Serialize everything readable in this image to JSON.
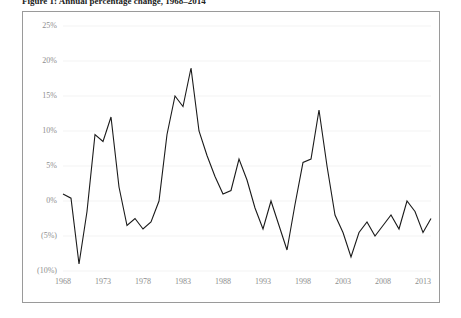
{
  "figure": {
    "caption": "Figure 1: Annual percentage change, 1968–2014"
  },
  "chart_data": {
    "type": "line",
    "title": "",
    "subtitle": "",
    "xlabel": "",
    "ylabel": "",
    "grid": true,
    "legend": "none",
    "xlim": [
      1968,
      2014
    ],
    "ylim": [
      -10,
      25
    ],
    "y_tick_values": [
      25,
      20,
      15,
      10,
      5,
      0,
      -5,
      -10
    ],
    "y_tick_labels": [
      "25%",
      "20%",
      "15%",
      "10%",
      "5%",
      "0%",
      "(5%)",
      "(10%)"
    ],
    "x_tick_values": [
      1968,
      1973,
      1978,
      1983,
      1988,
      1993,
      1998,
      2003,
      2008,
      2013
    ],
    "x_tick_labels": [
      "1968",
      "1973",
      "1978",
      "1983",
      "1988",
      "1993",
      "1998",
      "2003",
      "2008",
      "2013"
    ],
    "series": [
      {
        "name": "Annual change",
        "color": "#1a1a1a",
        "x": [
          1968,
          1969,
          1970,
          1971,
          1972,
          1973,
          1974,
          1975,
          1976,
          1977,
          1978,
          1979,
          1980,
          1981,
          1982,
          1983,
          1984,
          1985,
          1986,
          1987,
          1988,
          1989,
          1990,
          1991,
          1992,
          1993,
          1994,
          1995,
          1996,
          1997,
          1998,
          1999,
          2000,
          2001,
          2002,
          2003,
          2004,
          2005,
          2006,
          2007,
          2008,
          2009,
          2010,
          2011,
          2012,
          2013,
          2014
        ],
        "values": [
          1.0,
          0.4,
          -9.0,
          -1.5,
          9.5,
          8.5,
          12.0,
          2.0,
          -3.5,
          -2.5,
          -4.0,
          -3.0,
          0.0,
          9.5,
          15.0,
          13.5,
          19.0,
          10.0,
          6.5,
          3.5,
          1.0,
          1.5,
          6.0,
          3.0,
          -1.0,
          -4.0,
          0.0,
          -3.5,
          -7.0,
          -0.5,
          5.5,
          6.0,
          13.0,
          5.0,
          -2.0,
          -4.5,
          -8.0,
          -4.5,
          -3.0,
          -5.0,
          -3.5,
          -2.0,
          -4.0,
          0.0,
          -1.5,
          -4.5,
          -2.5
        ]
      }
    ]
  }
}
